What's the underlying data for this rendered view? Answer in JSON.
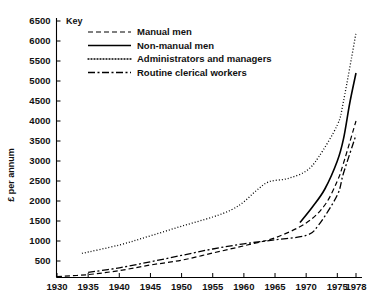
{
  "chart_data": {
    "type": "line",
    "title": "",
    "subtitle": "",
    "xlabel": "",
    "ylabel": "£ per annum",
    "xlim": [
      1930,
      1978
    ],
    "ylim": [
      0,
      6500
    ],
    "grid": false,
    "legend_position": "top-left",
    "legend_title": "Key",
    "x_ticks": [
      1930,
      1935,
      1940,
      1945,
      1950,
      1955,
      1960,
      1965,
      1970,
      1975,
      1978
    ],
    "y_ticks": [
      500,
      1000,
      1500,
      2000,
      2500,
      3000,
      3500,
      4000,
      4500,
      5000,
      5500,
      6000,
      6500
    ],
    "series": [
      {
        "name": "Manual men",
        "style": "dashed",
        "dash": "5,3",
        "width": 1.2,
        "points": [
          [
            1930,
            110
          ],
          [
            1935,
            160
          ],
          [
            1940,
            260
          ],
          [
            1945,
            400
          ],
          [
            1950,
            520
          ],
          [
            1955,
            700
          ],
          [
            1960,
            880
          ],
          [
            1965,
            1080
          ],
          [
            1970,
            1450
          ],
          [
            1973,
            1900
          ],
          [
            1975,
            2500
          ],
          [
            1976,
            2950
          ],
          [
            1978,
            4000
          ]
        ]
      },
      {
        "name": "Non-manual men",
        "style": "solid",
        "dash": "none",
        "width": 1.6,
        "points": [
          [
            1969,
            1460
          ],
          [
            1971,
            1850
          ],
          [
            1973,
            2300
          ],
          [
            1975,
            3000
          ],
          [
            1976,
            3560
          ],
          [
            1977,
            4450
          ],
          [
            1978,
            5200
          ]
        ]
      },
      {
        "name": "Administrators and managers",
        "style": "dotted",
        "dash": "1,2",
        "width": 1.3,
        "points": [
          [
            1934,
            690
          ],
          [
            1940,
            900
          ],
          [
            1945,
            1130
          ],
          [
            1950,
            1370
          ],
          [
            1955,
            1600
          ],
          [
            1958,
            1780
          ],
          [
            1960,
            1980
          ],
          [
            1962,
            2260
          ],
          [
            1964,
            2480
          ],
          [
            1967,
            2560
          ],
          [
            1970,
            2750
          ],
          [
            1972,
            3100
          ],
          [
            1975,
            3900
          ],
          [
            1976,
            4500
          ],
          [
            1978,
            6200
          ]
        ]
      },
      {
        "name": "Routine clerical workers",
        "style": "dash-dot",
        "dash": "7,2.5,2,2.5",
        "width": 1.3,
        "points": [
          [
            1935,
            215
          ],
          [
            1940,
            330
          ],
          [
            1945,
            480
          ],
          [
            1950,
            640
          ],
          [
            1955,
            800
          ],
          [
            1960,
            930
          ],
          [
            1965,
            1030
          ],
          [
            1970,
            1140
          ],
          [
            1972,
            1400
          ],
          [
            1975,
            2150
          ],
          [
            1976,
            2700
          ],
          [
            1978,
            3650
          ]
        ]
      }
    ]
  },
  "axes": {
    "y_axis_label": "£ per annum"
  },
  "legend": {
    "title": "Key",
    "entries": [
      {
        "label": "Manual men",
        "style": "dashed"
      },
      {
        "label": "Non-manual men",
        "style": "solid"
      },
      {
        "label": "Administrators and managers",
        "style": "dotted"
      },
      {
        "label": "Routine clerical workers",
        "style": "dash-dot"
      }
    ]
  }
}
